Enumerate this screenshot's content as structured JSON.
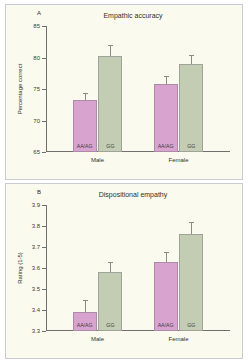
{
  "figure": {
    "background": "#fbfaef",
    "pink_color": "#d9a3d0",
    "green_color": "#c3cdb4"
  },
  "chart_data": [
    {
      "type": "bar",
      "panel": "A",
      "title": "Empathic accuracy",
      "xlabel": "",
      "ylabel": "Percentage correct",
      "ylim": [
        65,
        85
      ],
      "yticks": [
        65,
        70,
        75,
        80,
        85
      ],
      "ytick_labels": [
        "65",
        "70",
        "75",
        "80",
        "85"
      ],
      "grid": false,
      "legend": "none",
      "categories": [
        "Male",
        "Female"
      ],
      "series": [
        {
          "name": "AA/AG",
          "color": "#d9a3d0",
          "values": [
            73.2,
            75.8
          ],
          "errors": [
            1.0,
            1.1
          ]
        },
        {
          "name": "GG",
          "color": "#c3cdb4",
          "values": [
            80.2,
            79.0
          ],
          "errors": [
            1.7,
            1.3
          ]
        }
      ]
    },
    {
      "type": "bar",
      "panel": "B",
      "title": "Dispositional empathy",
      "xlabel": "",
      "ylabel": "Rating (1-5)",
      "ylim": [
        3.3,
        3.9
      ],
      "yticks": [
        3.3,
        3.4,
        3.5,
        3.6,
        3.7,
        3.8,
        3.9
      ],
      "ytick_labels": [
        "3.3",
        "3.4",
        "3.5",
        "3.6",
        "3.7",
        "3.8",
        "3.9"
      ],
      "grid": false,
      "legend": "none",
      "categories": [
        "Male",
        "Female"
      ],
      "series": [
        {
          "name": "AA/AG",
          "color": "#d9a3d0",
          "values": [
            3.39,
            3.63
          ],
          "errors": [
            0.055,
            0.042
          ]
        },
        {
          "name": "GG",
          "color": "#c3cdb4",
          "values": [
            3.58,
            3.76
          ],
          "errors": [
            0.045,
            0.055
          ]
        }
      ]
    }
  ]
}
